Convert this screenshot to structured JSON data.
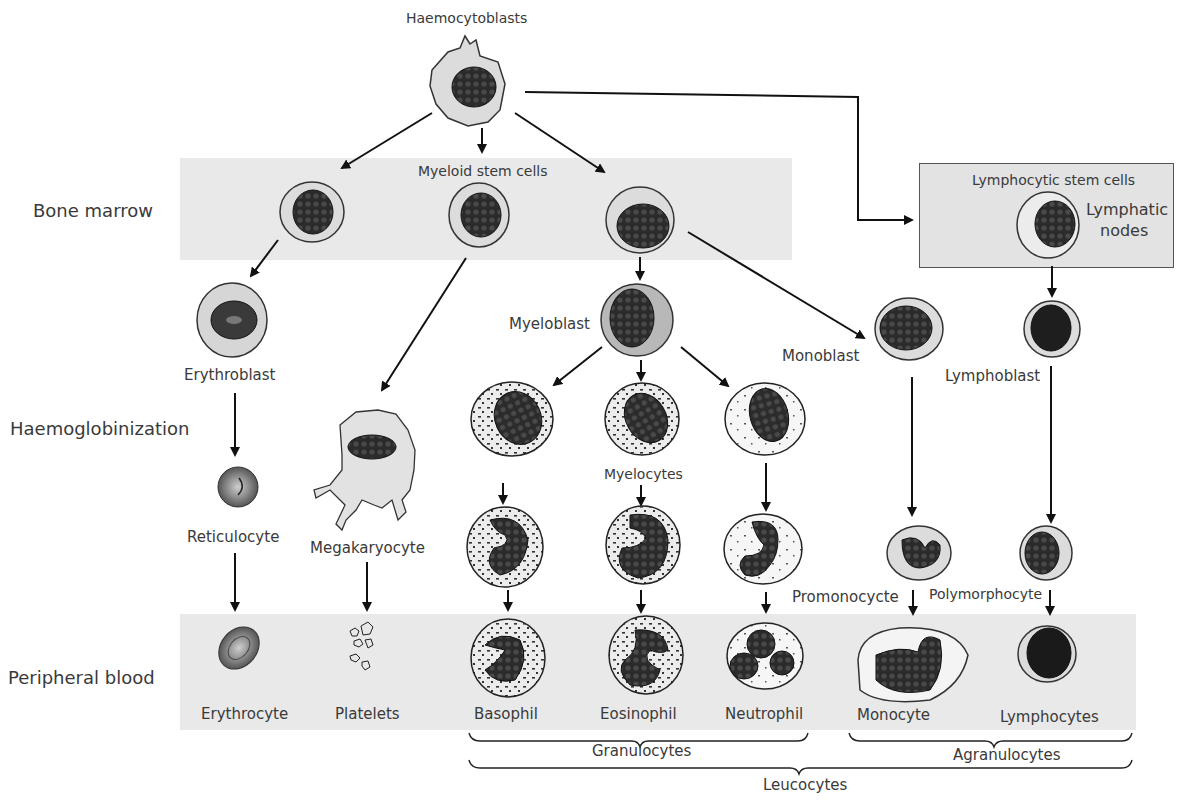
{
  "title": "Haemocytoblasts",
  "rows": {
    "bone_marrow": "Bone marrow",
    "haemoglobinization": "Haemoglobinization",
    "peripheral_blood": "Peripheral blood"
  },
  "stem_cells": {
    "myeloid": "Myeloid stem cells",
    "lymphocytic": "Lymphocytic stem cells",
    "lymphatic_nodes_line1": "Lymphatic",
    "lymphatic_nodes_line2": "nodes"
  },
  "intermediate_cells": {
    "erythroblast": "Erythroblast",
    "reticulocyte": "Reticulocyte",
    "megakaryocyte": "Megakaryocyte",
    "myeloblast": "Myeloblast",
    "myelocytes": "Myelocytes",
    "monoblast": "Monoblast",
    "lymphoblast": "Lymphoblast",
    "promonocyte": "Promonocycte",
    "polymorphocyte": "Polymorphocyte"
  },
  "mature_cells": [
    "Erythrocyte",
    "Platelets",
    "Basophil",
    "Eosinophil",
    "Neutrophil",
    "Monocyte",
    "Lymphocytes"
  ],
  "groups": {
    "granulocytes": "Granulocytes",
    "agranulocytes": "Agranulocytes",
    "leucocytes": "Leucocytes"
  },
  "colors": {
    "band": "#e9e9e9",
    "cytoplasm": "#dcdcdc",
    "nucleus": "#2b2b2b",
    "outline": "#333333"
  }
}
